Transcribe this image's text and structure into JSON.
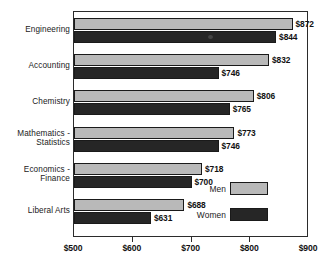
{
  "chart_data": {
    "type": "bar",
    "orientation": "horizontal",
    "title": "",
    "subtitle": "",
    "xlabel": "",
    "ylabel": "",
    "xlim": [
      500,
      900
    ],
    "grid": false,
    "legend_position": "inside-bottom-right",
    "categories": [
      "Engineering",
      "Accounting",
      "Chemistry",
      "Mathematics -\nStatistics",
      "Economics -\nFinance",
      "Liberal Arts"
    ],
    "series": [
      {
        "name": "Men",
        "color": "#b9b9b9",
        "values": [
          872,
          832,
          806,
          773,
          718,
          688
        ],
        "labels": [
          "$872",
          "$832",
          "$806",
          "$773",
          "$718",
          "$688"
        ]
      },
      {
        "name": "Women",
        "color": "#262626",
        "values": [
          844,
          746,
          765,
          746,
          700,
          631
        ],
        "labels": [
          "$844",
          "$746",
          "$765",
          "$746",
          "$700",
          "$631"
        ]
      }
    ],
    "xticks": [
      500,
      600,
      700,
      800,
      900
    ],
    "xtick_labels": [
      "$500",
      "$600",
      "$700",
      "$800",
      "$900"
    ]
  },
  "legend": {
    "items": [
      {
        "label": "Men",
        "color": "#b9b9b9"
      },
      {
        "label": "Women",
        "color": "#262626"
      }
    ]
  }
}
